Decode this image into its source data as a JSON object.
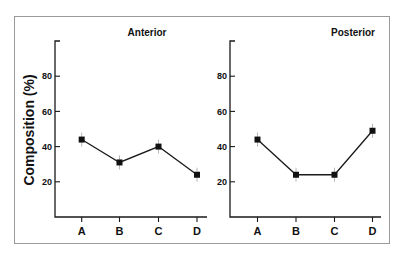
{
  "chart_data": [
    {
      "type": "line",
      "title": "Anterior",
      "xlabel": "",
      "ylabel": "Composition (%)",
      "categories": [
        "A",
        "B",
        "C",
        "D"
      ],
      "values": [
        44,
        31,
        40,
        24
      ],
      "error": [
        4,
        4,
        4,
        4
      ],
      "yticks": [
        20,
        40,
        60,
        80
      ],
      "ylim": [
        0,
        100
      ],
      "grid": false,
      "marker": "square"
    },
    {
      "type": "line",
      "title": "Posterior",
      "xlabel": "",
      "ylabel": "",
      "categories": [
        "A",
        "B",
        "C",
        "D"
      ],
      "values": [
        44,
        24,
        24,
        49
      ],
      "error": [
        4,
        4,
        4,
        4
      ],
      "yticks": [
        20,
        40,
        60,
        80
      ],
      "ylim": [
        0,
        100
      ],
      "grid": false,
      "marker": "square"
    }
  ],
  "figure": {
    "ylabel": "Composition (%)",
    "panels": [
      {
        "title": "Anterior"
      },
      {
        "title": "Posterior"
      }
    ],
    "colors": {
      "line": "#1a1a1a",
      "marker": "#111111",
      "errorbar": "#b8b8b8",
      "frame": "#9a9a9a"
    }
  }
}
